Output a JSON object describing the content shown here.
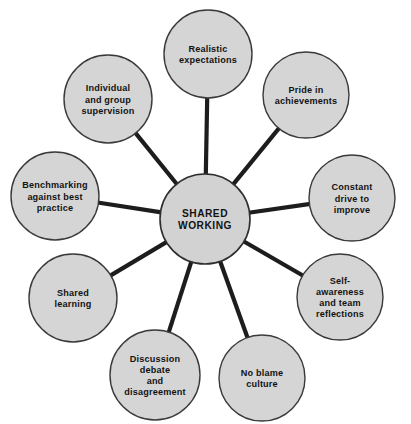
{
  "diagram": {
    "type": "hub-and-spoke",
    "hub": {
      "id": "shared-working",
      "lines": [
        "SHARED",
        "WORKING"
      ],
      "cx": 205,
      "cy": 219,
      "r": 45
    },
    "style": {
      "node_fill": "#d5d5d5",
      "node_stroke": "#3a3a3a",
      "spoke_color": "#1d1d1d",
      "text_color": "#121212",
      "background": "#ffffff"
    },
    "nodes": [
      {
        "id": "realistic-expectations",
        "lines": [
          "Realistic",
          "expectations"
        ],
        "cx": 208,
        "cy": 54,
        "r": 44
      },
      {
        "id": "pride-in-achievements",
        "lines": [
          "Pride in",
          "achievements"
        ],
        "cx": 306,
        "cy": 95,
        "r": 43
      },
      {
        "id": "constant-drive-to-improve",
        "lines": [
          "Constant",
          "drive to",
          "improve"
        ],
        "cx": 352,
        "cy": 198,
        "r": 43
      },
      {
        "id": "self-awareness-and-team-reflections",
        "lines": [
          "Self-",
          "awareness",
          "and team",
          "reflections"
        ],
        "cx": 340,
        "cy": 297,
        "r": 43
      },
      {
        "id": "no-blame-culture",
        "lines": [
          "No blame",
          "culture"
        ],
        "cx": 262,
        "cy": 378,
        "r": 43
      },
      {
        "id": "discussion-debate-and-disagreement",
        "lines": [
          "Discussion",
          "debate",
          "and",
          "disagreement"
        ],
        "cx": 155,
        "cy": 375,
        "r": 45
      },
      {
        "id": "shared-learning",
        "lines": [
          "Shared",
          "learning"
        ],
        "cx": 73,
        "cy": 298,
        "r": 44
      },
      {
        "id": "benchmarking-against-best-practice",
        "lines": [
          "Benchmarking",
          "against best",
          "practice"
        ],
        "cx": 55,
        "cy": 196,
        "r": 44
      },
      {
        "id": "individual-and-group-supervision",
        "lines": [
          "Individual",
          "and group",
          "supervision"
        ],
        "cx": 108,
        "cy": 99,
        "r": 44
      }
    ]
  },
  "caption": {
    "text": ""
  }
}
